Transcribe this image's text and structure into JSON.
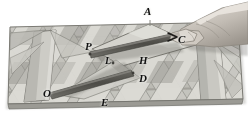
{
  "figure": {
    "kind": "photograph-illustration",
    "palette": {
      "background": "#ffffff",
      "mat_light": "#d9d8d2",
      "mat_mid": "#bdbcb5",
      "mat_dark": "#9b9a93",
      "mat_shadow": "#7f7e78",
      "strip_dark": "#56554f",
      "outline": "#6e6d67",
      "hand_light": "#d7d2cb",
      "hand_mid": "#b3ada5",
      "hand_shade": "#8d8880",
      "label_color": "#111111"
    }
  },
  "labels": [
    {
      "id": "A",
      "text": "A",
      "x": 144,
      "y": 8,
      "size": 11
    },
    {
      "id": "C",
      "text": "C",
      "x": 178,
      "y": 36,
      "size": 11
    },
    {
      "id": "P",
      "text": "P",
      "x": 86,
      "y": 43,
      "size": 11
    },
    {
      "id": "L",
      "text": "L",
      "x": 106,
      "y": 59,
      "size": 10
    },
    {
      "id": "H",
      "text": "H",
      "x": 140,
      "y": 58,
      "size": 11
    },
    {
      "id": "D",
      "text": "D",
      "x": 140,
      "y": 76,
      "size": 11
    },
    {
      "id": "O",
      "text": "O",
      "x": 44,
      "y": 91,
      "size": 11
    },
    {
      "id": "E",
      "text": "E",
      "x": 102,
      "y": 99,
      "size": 11
    }
  ],
  "segments": [
    {
      "id": "P-C",
      "from": "P",
      "to": "C",
      "style": "thick-dark-strip"
    },
    {
      "id": "O-L-D",
      "from": "O",
      "to": "D",
      "style": "thick-dark-strip",
      "through": "L"
    }
  ],
  "hand": {
    "present": true,
    "description": "right hand entering from upper-right, index finger and thumb pinching the strip end at C"
  }
}
